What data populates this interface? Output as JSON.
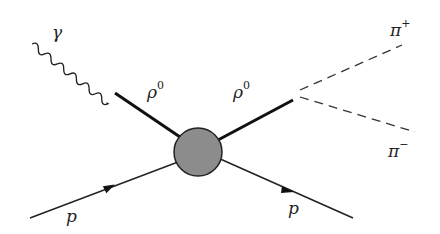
{
  "diagram": {
    "type": "feynman",
    "title": "",
    "nodes": {
      "vertex_blob": {
        "cx": 198,
        "cy": 152,
        "r": 24,
        "fill": "#8c8c8c"
      }
    },
    "labels": {
      "photon": {
        "base": "γ",
        "sup": ""
      },
      "rho_in": {
        "base": "ρ",
        "sup": "0"
      },
      "rho_out": {
        "base": "ρ",
        "sup": "0"
      },
      "pi_plus": {
        "base": "π",
        "sup": "+"
      },
      "pi_minus": {
        "base": "π",
        "sup": "−"
      },
      "proton_in": {
        "base": "p",
        "sup": ""
      },
      "proton_out": {
        "base": "p",
        "sup": ""
      }
    },
    "edges": [
      {
        "from": "photon_start",
        "to": "rho_vertex",
        "style": "wavy",
        "particle": "γ"
      },
      {
        "from": "rho_vertex",
        "to": "vertex_blob",
        "style": "thick",
        "particle": "ρ0"
      },
      {
        "from": "vertex_blob",
        "to": "decay_vertex",
        "style": "thick",
        "particle": "ρ0"
      },
      {
        "from": "decay_vertex",
        "to": "pi_plus_end",
        "style": "dashed",
        "particle": "π+"
      },
      {
        "from": "decay_vertex",
        "to": "pi_minus_end",
        "style": "dashed",
        "particle": "π−"
      },
      {
        "from": "proton_in_start",
        "to": "vertex_blob",
        "style": "arrow",
        "particle": "p"
      },
      {
        "from": "vertex_blob",
        "to": "proton_out_end",
        "style": "arrow",
        "particle": "p"
      }
    ]
  }
}
